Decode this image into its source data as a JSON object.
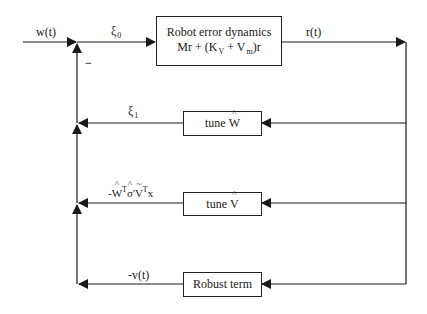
{
  "diagram": {
    "type": "block-diagram",
    "blocks": {
      "robot": {
        "title": "Robot error dynamics",
        "equation_M": "M",
        "equation_r": "r",
        "equation_mid": " + (K",
        "equation_kv_sub": "V",
        "equation_plus": " + V",
        "equation_vm_sub": "m",
        "equation_end": ")r"
      },
      "tune_w": {
        "prefix": "tune ",
        "symbol": "W"
      },
      "tune_v": {
        "prefix": "tune ",
        "symbol": "V"
      },
      "robust": {
        "label": "Robust term"
      }
    },
    "signals": {
      "input": "w(t)",
      "xi0": {
        "base": "ξ",
        "sub": "0"
      },
      "output": "r(t)",
      "minus_sign": "−",
      "xi1": {
        "base": "ξ",
        "sub": "1"
      },
      "tune_v_out": {
        "neg": "-",
        "w": "W",
        "t1": "T",
        "sigma": "σ",
        "prime": "'",
        "v": "V",
        "t2": "T",
        "x": "x"
      },
      "robust_out": "-v(t)"
    },
    "colors": {
      "line": "#1a1a1a",
      "background": "#ffffff"
    }
  }
}
